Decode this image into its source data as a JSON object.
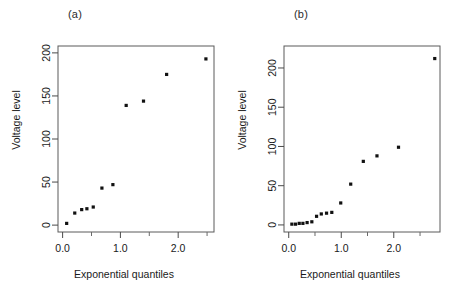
{
  "figure": {
    "panels": [
      {
        "label": "(a)",
        "xlabel": "Exponential quantiles",
        "ylabel": "Voltage level"
      },
      {
        "label": "(b)",
        "xlabel": "Exponential quantiles",
        "ylabel": "Voltage level"
      }
    ]
  },
  "chart_data": [
    {
      "type": "scatter",
      "title": "(a)",
      "xlabel": "Exponential quantiles",
      "ylabel": "Voltage level",
      "xlim": [
        -0.08,
        2.62
      ],
      "ylim": [
        -8,
        208
      ],
      "xticks": [
        0.0,
        1.0,
        2.0
      ],
      "xticklabels": [
        "0.0",
        "1.0",
        "2.0"
      ],
      "xminorticks": [
        0.5,
        1.5,
        2.5
      ],
      "yticks": [
        0,
        50,
        100,
        150,
        200
      ],
      "yticklabels": [
        "0",
        "50",
        "100",
        "150",
        "200"
      ],
      "grid": false,
      "legend": null,
      "marker": "filled-square",
      "x": [
        0.07,
        0.21,
        0.33,
        0.42,
        0.53,
        0.68,
        0.87,
        1.1,
        1.4,
        1.8,
        2.48
      ],
      "y": [
        2,
        14,
        18,
        19,
        21,
        43,
        47,
        139,
        144,
        175,
        193
      ]
    },
    {
      "type": "scatter",
      "title": "(b)",
      "xlabel": "Exponential quantiles",
      "ylabel": "Voltage level",
      "xlim": [
        -0.09,
        2.88
      ],
      "ylim": [
        -9,
        228
      ],
      "xticks": [
        0.0,
        1.0,
        2.0
      ],
      "xticklabels": [
        "0.0",
        "1.0",
        "2.0"
      ],
      "xminorticks": [
        0.5,
        1.5,
        2.5
      ],
      "yticks": [
        0,
        50,
        100,
        150,
        200
      ],
      "yticklabels": [
        "0",
        "50",
        "100",
        "150",
        "200"
      ],
      "grid": false,
      "legend": null,
      "marker": "filled-square",
      "x": [
        0.06,
        0.13,
        0.2,
        0.27,
        0.35,
        0.44,
        0.53,
        0.62,
        0.72,
        0.82,
        0.99,
        1.18,
        1.42,
        1.68,
        2.09,
        2.78
      ],
      "y": [
        1,
        1,
        2,
        2,
        3,
        4,
        11,
        14,
        15,
        16,
        28,
        52,
        81,
        88,
        99,
        212
      ]
    }
  ]
}
